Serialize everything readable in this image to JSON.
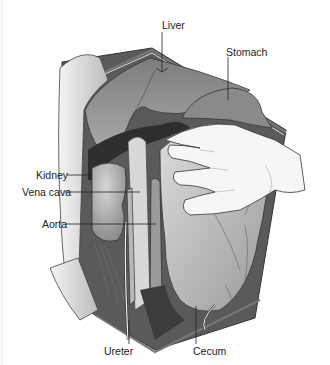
{
  "figure": {
    "labels": {
      "liver": "Liver",
      "stomach": "Stomach",
      "kidney": "Kidney",
      "vena_cava": "Vena cava",
      "aorta": "Aorta",
      "ureter": "Ureter",
      "cecum": "Cecum"
    },
    "colors": {
      "background": "#ffffff",
      "organ_dark": "#3a3a3a",
      "organ_mid": "#8a8a8a",
      "organ_light": "#c4c4c4",
      "skin": "#f2f2f2",
      "line": "#222222"
    }
  }
}
